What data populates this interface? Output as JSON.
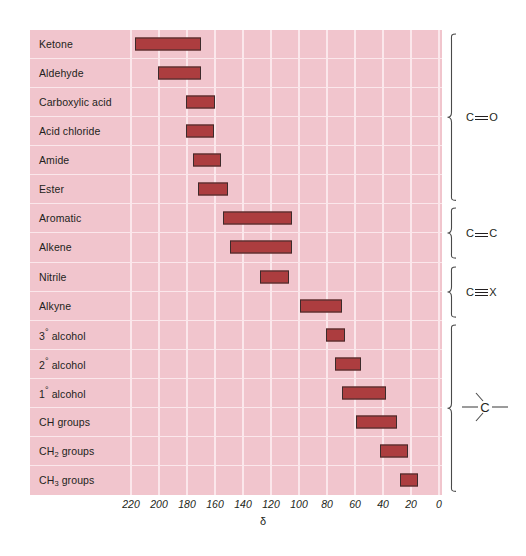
{
  "figure": {
    "top_caption": "",
    "axis_symbol": "δ",
    "colors": {
      "panel_background": "#f1c5cd",
      "gridline": "#fbe7eb",
      "bar_fill": "#ac3d3f",
      "bar_stroke": "#3c2b2b",
      "text": "#231f20"
    }
  },
  "chart_data": {
    "type": "bar",
    "title": "",
    "xlabel": "δ",
    "ylabel": "",
    "xlim": [
      220,
      0
    ],
    "x_inverted": true,
    "grid": true,
    "legend": "none",
    "orientation": "horizontal-range",
    "xticks": [
      220,
      200,
      180,
      160,
      140,
      120,
      100,
      80,
      60,
      40,
      20,
      0
    ],
    "xticklabels": [
      "220",
      "200",
      "180",
      "160",
      "140",
      "120",
      "100",
      "80",
      "60",
      "40",
      "20",
      "0"
    ],
    "categories": [
      "Ketone",
      "Aldehyde",
      "Carboxylic acid",
      "Acid chloride",
      "Amide",
      "Ester",
      "Aromatic",
      "Alkene",
      "Nitrile",
      "Alkyne",
      "3° alcohol",
      "2° alcohol",
      "1° alcohol",
      "CH groups",
      "CH₂ groups",
      "CH₃ groups"
    ],
    "ranges": [
      [
        170,
        217
      ],
      [
        170,
        201
      ],
      [
        160,
        181
      ],
      [
        161,
        181
      ],
      [
        156,
        176
      ],
      [
        151,
        172
      ],
      [
        105,
        154
      ],
      [
        105,
        149
      ],
      [
        107,
        128
      ],
      [
        69,
        99
      ],
      [
        67,
        81
      ],
      [
        56,
        74
      ],
      [
        38,
        69
      ],
      [
        30,
        59
      ],
      [
        22,
        42
      ],
      [
        15,
        28
      ]
    ],
    "units": "ppm"
  },
  "rows": [
    {
      "label": "Ketone",
      "label_html": "Ketone",
      "low": 170,
      "high": 217
    },
    {
      "label": "Aldehyde",
      "label_html": "Aldehyde",
      "low": 170,
      "high": 201
    },
    {
      "label": "Carboxylic acid",
      "label_html": "Carboxylic acid",
      "low": 160,
      "high": 181
    },
    {
      "label": "Acid chloride",
      "label_html": "Acid chloride",
      "low": 161,
      "high": 181
    },
    {
      "label": "Amide",
      "label_html": "Amide",
      "low": 156,
      "high": 176
    },
    {
      "label": "Ester",
      "label_html": "Ester",
      "low": 151,
      "high": 172
    },
    {
      "label": "Aromatic",
      "label_html": "Aromatic",
      "low": 105,
      "high": 154
    },
    {
      "label": "Alkene",
      "label_html": "Alkene",
      "low": 105,
      "high": 149
    },
    {
      "label": "Nitrile",
      "label_html": "Nitrile",
      "low": 107,
      "high": 128
    },
    {
      "label": "Alkyne",
      "label_html": "Alkyne",
      "low": 69,
      "high": 99
    },
    {
      "label": "3° alcohol",
      "label_html": "3<span class=\"deg\">°</span> alcohol",
      "low": 67,
      "high": 81
    },
    {
      "label": "2° alcohol",
      "label_html": "2<span class=\"deg\">°</span> alcohol",
      "low": 56,
      "high": 74
    },
    {
      "label": "1° alcohol",
      "label_html": "1<span class=\"deg\">°</span> alcohol",
      "low": 38,
      "high": 69
    },
    {
      "label": "CH groups",
      "label_html": "CH groups",
      "low": 30,
      "high": 59
    },
    {
      "label": "CH2 groups",
      "label_html": "CH<sub>2</sub> groups",
      "low": 22,
      "high": 42
    },
    {
      "label": "CH3 groups",
      "label_html": "CH<sub>3</sub> groups",
      "low": 15,
      "high": 28
    }
  ],
  "brace_groups": [
    {
      "name": "carbonyl",
      "label": "C=O",
      "kind": "double",
      "left_atom": "C",
      "right_atom": "O",
      "first_row": 0,
      "last_row": 5
    },
    {
      "name": "alkene",
      "label": "C=C",
      "kind": "double",
      "left_atom": "C",
      "right_atom": "C",
      "first_row": 6,
      "last_row": 7
    },
    {
      "name": "triple-bond",
      "label": "C≡X",
      "kind": "triple",
      "left_atom": "C",
      "right_atom": "X",
      "first_row": 8,
      "last_row": 9
    },
    {
      "name": "sp3-carbon",
      "label": "–C–",
      "kind": "sp3",
      "left_atom": "",
      "right_atom": "",
      "first_row": 10,
      "last_row": 15
    }
  ]
}
